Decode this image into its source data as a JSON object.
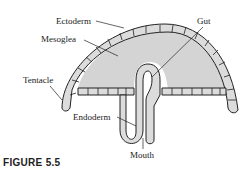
{
  "figure": {
    "caption": "FIGURE 5.5",
    "labels": {
      "ectoderm": "Ectoderm",
      "mesoglea": "Mesoglea",
      "gut": "Gut",
      "tentacle": "Tentacle",
      "endoderm": "Endoderm",
      "mouth": "Mouth"
    },
    "colors": {
      "mesoglea_fill": "#d4d4d4",
      "cell_fill": "#dcdcdc",
      "outline": "#222222"
    }
  }
}
